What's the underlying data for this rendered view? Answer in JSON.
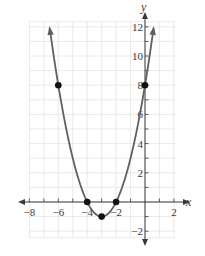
{
  "chart_data": {
    "type": "line",
    "title": "",
    "xlabel": "x",
    "ylabel": "y",
    "xlim": [
      -8,
      2
    ],
    "ylim": [
      -2,
      12
    ],
    "grid": true,
    "x_ticks": [
      -8,
      -6,
      -4,
      -2,
      2
    ],
    "y_ticks": [
      -2,
      2,
      4,
      6,
      8,
      10,
      12
    ],
    "x_tick_labels": [
      "−8",
      "−6",
      "−4",
      "−2",
      "2"
    ],
    "y_tick_labels": [
      "−2",
      "2",
      "4",
      "6",
      "8",
      "10",
      "12"
    ],
    "series": [
      {
        "name": "parabola",
        "equation": "y = x^2 + 6x + 8",
        "vertex": [
          -3,
          -1
        ],
        "color": "#606060",
        "arrows_both_ends": true
      }
    ],
    "points": [
      {
        "x": -6,
        "y": 8
      },
      {
        "x": -4,
        "y": 0
      },
      {
        "x": -3,
        "y": -1
      },
      {
        "x": -2,
        "y": 0
      },
      {
        "x": 0,
        "y": 8
      }
    ],
    "colors": {
      "grid": "#e4e4e4",
      "axis": "#3a3a3a",
      "curve": "#606060",
      "point": "#111111"
    }
  }
}
